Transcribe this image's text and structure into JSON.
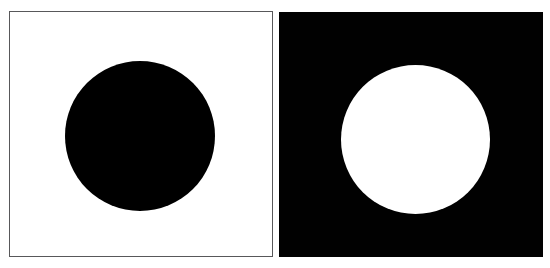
{
  "figure": {
    "title": "Black disc on white field and white disc on black field",
    "background_color": "#ffffff",
    "width": 550,
    "height": 268,
    "panels": [
      {
        "id": "left",
        "name": "black-disc-on-white",
        "field_color": "#ffffff",
        "disc_color": "#000000",
        "border_color": "#58585a",
        "border_width": 1,
        "x": 9,
        "y": 11,
        "width": 264,
        "height": 246,
        "disc": {
          "center_x": 139,
          "center_y": 135,
          "diameter": 150,
          "radius": 75
        },
        "caption": ""
      },
      {
        "id": "right",
        "name": "white-disc-on-black",
        "field_color": "#010101",
        "disc_color": "#ffffff",
        "border_color": "#010101",
        "border_width": 0,
        "x": 279,
        "y": 12,
        "width": 264,
        "height": 245,
        "disc": {
          "center_x": 415,
          "center_y": 139,
          "diameter": 149,
          "radius": 74
        },
        "caption": ""
      }
    ]
  }
}
